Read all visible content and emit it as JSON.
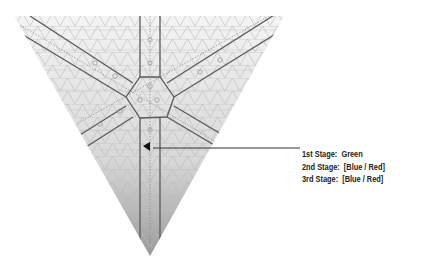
{
  "diagram": {
    "shape": "inverted-triangle",
    "grid": "triangular",
    "colors": {
      "line": "#555555",
      "grid": "#bbbbbb",
      "fill_top": "#f2f2f2",
      "fill_bottom": "#9a9a9a"
    }
  },
  "legend": {
    "items": [
      {
        "label": "1st Stage:",
        "value": "Green"
      },
      {
        "label": "2nd Stage:",
        "value": "[Blue / Red]"
      },
      {
        "label": "3rd Stage:",
        "value": "[Blue / Red]"
      }
    ]
  },
  "pointer": {
    "from": [
      300,
      148
    ],
    "to": [
      153,
      148
    ]
  }
}
